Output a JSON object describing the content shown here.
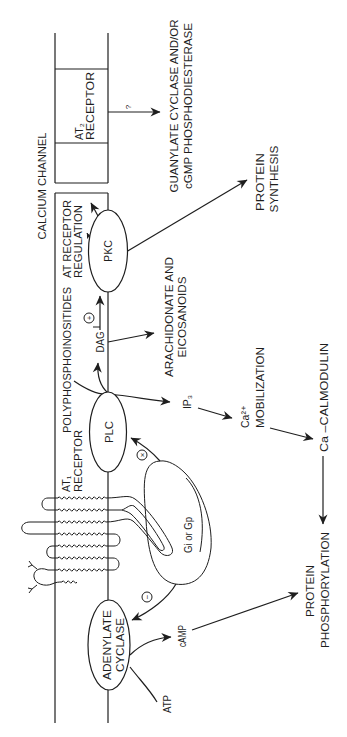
{
  "channel": {
    "label": "CALCIUM CHANNEL"
  },
  "receptors": {
    "at2": {
      "line1": "AT₂",
      "line2": "RECEPTOR"
    },
    "at1": {
      "line1": "AT₁",
      "line2": "RECEPTOR"
    },
    "regulation": {
      "line1": "AT RECEPTOR",
      "line2": "REGULATION"
    }
  },
  "enzymes": {
    "pkc": "PKC",
    "plc": "PLC",
    "adenylate_cyclase": {
      "line1": "ADENYLATE",
      "line2": "CYCLASE"
    }
  },
  "g_protein": {
    "label": "Gi or Gp"
  },
  "substrates": {
    "polyphosphoinositides": "POLYPHOSPHOINOSITIDES",
    "atp": "ATP"
  },
  "messengers": {
    "dag": "DAG",
    "ip3": "IP₃",
    "camp": "cAMP",
    "ca_mobilization": {
      "line1": "Ca²⁺",
      "line2": "MOBILIZATION"
    },
    "ca_calmodulin": "Ca –CALMODULIN"
  },
  "outcomes": {
    "guanylate": {
      "line1": "GUANYLATE CYCLASE AND/OR",
      "line2": "cGMP PHOSPHODIESTERASE"
    },
    "protein_synthesis": {
      "line1": "PROTEIN",
      "line2": "SYNTHESIS"
    },
    "arachidonate": {
      "line1": "ARACHIDONATE AND",
      "line2": "EICOSANOIDS"
    },
    "protein_phosphorylation": {
      "line1": "PROTEIN",
      "line2": "PHOSPHORYLATION"
    }
  },
  "modifiers": {
    "unknown": "?",
    "stimulate": "+",
    "activate": "×",
    "inhibit": "−"
  },
  "edges": [
    {
      "from": "AT₂ RECEPTOR",
      "to": "GUANYLATE CYCLASE AND/OR cGMP PHOSPHODIESTERASE",
      "sign": "?"
    },
    {
      "from": "PKC",
      "to": "AT RECEPTOR REGULATION",
      "sign": ""
    },
    {
      "from": "PKC",
      "to": "PROTEIN SYNTHESIS",
      "sign": ""
    },
    {
      "from": "DAG",
      "to": "PKC",
      "sign": "+"
    },
    {
      "from": "POLYPHOSPHOINOSITIDES",
      "to": "DAG",
      "sign": ""
    },
    {
      "from": "POLYPHOSPHOINOSITIDES",
      "to": "IP₃",
      "sign": ""
    },
    {
      "from": "DAG",
      "to": "ARACHIDONATE AND EICOSANOIDS",
      "sign": ""
    },
    {
      "from": "IP₃",
      "to": "Ca²⁺ MOBILIZATION",
      "sign": ""
    },
    {
      "from": "Ca²⁺ MOBILIZATION",
      "to": "Ca –CALMODULIN",
      "sign": ""
    },
    {
      "from": "Ca –CALMODULIN",
      "to": "PROTEIN PHOSPHORYLATION",
      "sign": ""
    },
    {
      "from": "Gi or Gp",
      "to": "PLC",
      "sign": "×"
    },
    {
      "from": "Gi or Gp",
      "to": "ADENYLATE CYCLASE",
      "sign": "−"
    },
    {
      "from": "ATP",
      "to": "cAMP",
      "sign": ""
    },
    {
      "from": "cAMP",
      "to": "PROTEIN PHOSPHORYLATION",
      "sign": ""
    }
  ],
  "colors": {
    "ink": "#1e1e1e",
    "background": "#ffffff"
  }
}
